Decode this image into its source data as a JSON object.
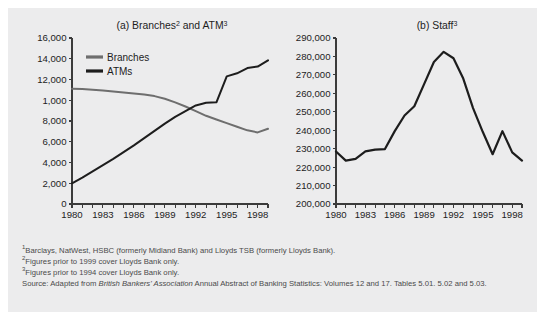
{
  "figure": {
    "background_color": "#ececed",
    "notes": [
      {
        "marker": "1",
        "text": "Barclays, NatWest, HSBC (formerly Midland Bank) and Lloyds TSB (formerly Lloyds Bank)."
      },
      {
        "marker": "2",
        "text": "Figures prior to 1999 cover Lloyds Bank only."
      },
      {
        "marker": "3",
        "text": "Figures prior to 1994 cover Lloyds Bank only."
      }
    ],
    "source": {
      "prefix": "Source: Adapted from ",
      "italic": "British Bankers' Association",
      "suffix": " Annual Abstract of Banking Statistics: Volumes 12 and 17. Tables 5.01. 5.02 and 5.03."
    }
  },
  "chart_data": [
    {
      "id": "chart-a",
      "type": "line",
      "title": "(a) Branches",
      "title_sup_1": "2",
      "title_mid": " and ATM",
      "title_sup_2": "3",
      "xlabel": "",
      "ylabel": "",
      "xlim": [
        1980,
        1999
      ],
      "ylim": [
        0,
        16000
      ],
      "grid": false,
      "legend_position": "top-left",
      "x": [
        1980,
        1981,
        1982,
        1983,
        1984,
        1985,
        1986,
        1987,
        1988,
        1989,
        1990,
        1991,
        1992,
        1993,
        1994,
        1995,
        1996,
        1997,
        1998,
        1999
      ],
      "y_ticks": [
        0,
        2000,
        4000,
        6000,
        8000,
        10000,
        12000,
        14000,
        16000
      ],
      "y_tick_labels": [
        "0",
        "2,000",
        "4,000",
        "6,000",
        "8,000",
        "1,000",
        "12,000",
        "14,000",
        "16,000"
      ],
      "x_ticks": [
        1980,
        1981,
        1982,
        1983,
        1984,
        1985,
        1986,
        1987,
        1988,
        1989,
        1990,
        1991,
        1992,
        1993,
        1994,
        1995,
        1996,
        1997,
        1998,
        1999
      ],
      "x_tick_labels": [
        {
          "value": 1980,
          "label": "1980"
        },
        {
          "value": 1983,
          "label": "1983"
        },
        {
          "value": 1986,
          "label": "1986"
        },
        {
          "value": 1989,
          "label": "1989"
        },
        {
          "value": 1992,
          "label": "1992"
        },
        {
          "value": 1995,
          "label": "1995"
        },
        {
          "value": 1998,
          "label": "1998"
        }
      ],
      "series": [
        {
          "name": "Branches",
          "color": "#6e6e6e",
          "width": 2.0,
          "values": [
            11100,
            11080,
            11020,
            10950,
            10850,
            10750,
            10650,
            10550,
            10400,
            10150,
            9800,
            9400,
            8950,
            8500,
            8150,
            7800,
            7450,
            7100,
            6900,
            7250
          ]
        },
        {
          "name": "ATMs",
          "color": "#1d1d1d",
          "width": 2.0,
          "values": [
            2000,
            2550,
            3150,
            3750,
            4350,
            5000,
            5650,
            6350,
            7050,
            7750,
            8400,
            8950,
            9500,
            9750,
            9800,
            12300,
            12600,
            13100,
            13250,
            13850
          ]
        }
      ]
    },
    {
      "id": "chart-b",
      "type": "line",
      "title": "(b) Staff",
      "title_sup_1": "3",
      "title_mid": "",
      "title_sup_2": "",
      "xlabel": "",
      "ylabel": "",
      "xlim": [
        1980,
        1999
      ],
      "ylim": [
        200000,
        290000
      ],
      "grid": false,
      "legend_position": "none",
      "x": [
        1980,
        1981,
        1982,
        1983,
        1984,
        1985,
        1986,
        1987,
        1988,
        1989,
        1990,
        1991,
        1992,
        1993,
        1994,
        1995,
        1996,
        1997,
        1998,
        1999
      ],
      "y_ticks": [
        200000,
        210000,
        220000,
        230000,
        240000,
        250000,
        260000,
        270000,
        280000,
        290000
      ],
      "y_tick_labels": [
        "200,000",
        "210,000",
        "220,000",
        "230,000",
        "240,000",
        "250,000",
        "260,000",
        "270,000",
        "280,000",
        "290,000"
      ],
      "x_ticks": [
        1980,
        1981,
        1982,
        1983,
        1984,
        1985,
        1986,
        1987,
        1988,
        1989,
        1990,
        1991,
        1992,
        1993,
        1994,
        1995,
        1996,
        1997,
        1998,
        1999
      ],
      "x_tick_labels": [
        {
          "value": 1980,
          "label": "1980"
        },
        {
          "value": 1983,
          "label": "1983"
        },
        {
          "value": 1986,
          "label": "1986"
        },
        {
          "value": 1989,
          "label": "1989"
        },
        {
          "value": 1992,
          "label": "1992"
        },
        {
          "value": 1995,
          "label": "1995"
        },
        {
          "value": 1998,
          "label": "1998"
        }
      ],
      "series": [
        {
          "name": "Staff",
          "color": "#1d1d1d",
          "width": 2.2,
          "values": [
            228500,
            223500,
            224500,
            228500,
            229500,
            229800,
            239500,
            248000,
            253000,
            265000,
            277000,
            282500,
            279000,
            268000,
            252000,
            239000,
            227000,
            239500,
            228000,
            223500
          ]
        }
      ]
    }
  ]
}
